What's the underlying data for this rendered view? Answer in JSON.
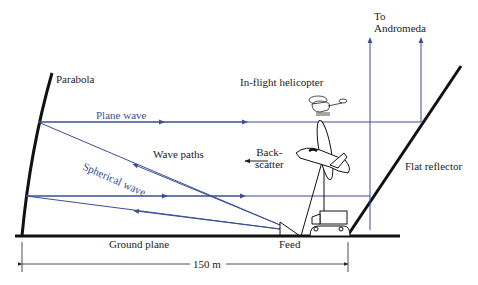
{
  "diagram": {
    "type": "antenna-range-schematic",
    "colors": {
      "ray": "#3a4f95",
      "structure": "#111111",
      "text": "#222222"
    },
    "labels": {
      "to_andromeda_1": "To",
      "to_andromeda_2": "Andromeda",
      "parabola": "Parabola",
      "helicopter": "In-flight helicopter",
      "plane_wave": "Plane wave",
      "spherical_wave": "Spherical wave",
      "wave_paths": "Wave paths",
      "backscatter_1": "Back-",
      "backscatter_2": "scatter",
      "flat_reflector": "Flat reflector",
      "ground_plane": "Ground plane",
      "feed": "Feed",
      "distance": "150 m"
    },
    "dimension": {
      "value": 150,
      "unit": "m"
    }
  }
}
